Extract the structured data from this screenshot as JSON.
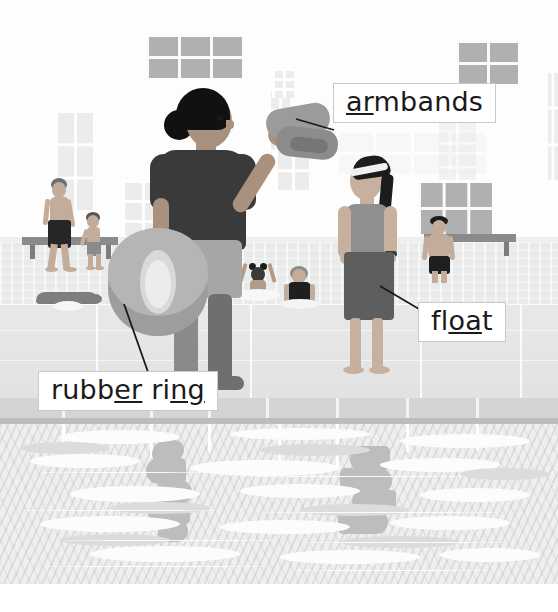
{
  "illustration": {
    "title": "Swimming pool vocabulary scene",
    "alt": "Cartoon swimming pool with a woman holding a rubber ring and armbands, a girl holding a float, and swimmers in the water",
    "width": 558,
    "height": 612
  },
  "labels": [
    {
      "id": "armbands",
      "name": "label-armbands",
      "text_before": "",
      "underlined": "ar",
      "text_after": "mbands",
      "full_text": "armbands",
      "x": 333,
      "y": 83,
      "leader": {
        "x1": 333,
        "y1": 131,
        "x2": 296,
        "y2": 121
      }
    },
    {
      "id": "float",
      "name": "label-float",
      "text_before": "fl",
      "underlined": "oa",
      "text_after": "t",
      "full_text": "float",
      "x": 418,
      "y": 302,
      "leader": {
        "x1": 418,
        "y1": 310,
        "x2": 381,
        "y2": 287
      }
    },
    {
      "id": "rubber-ring",
      "name": "label-rubber-ring",
      "text_before": "rubb",
      "underlined": "er",
      "text_mid": " ri",
      "underlined2": "ng",
      "text_after": "",
      "full_text": "rubber ring",
      "x": 38,
      "y": 371,
      "leader": {
        "x1": 147,
        "y1": 371,
        "x2": 123,
        "y2": 305
      }
    }
  ],
  "palette": {
    "paper": "#ffffff",
    "wall": "#fdfdfd",
    "window_dark": "#b0b0b0",
    "window_pale": "#ececec",
    "deck": "#e8e8e8",
    "coping": "#d4d4d4",
    "water": "#efefef",
    "water_dark": "#bcbcbc",
    "skin_mid": "#b9a08d",
    "skin_light": "#cdb7a4",
    "hair_dark": "#1c1c1c",
    "shirt_dark": "#3a3a3a",
    "swimsuit_grey": "#8f8f8f",
    "float_dark": "#5e5e5e",
    "ring_grey": "#a9a9a9",
    "ink": "#1a1a1a"
  },
  "figures": [
    {
      "name": "woman-with-ring",
      "description": "adult woman in dark t-shirt holding a rubber ring and armbands"
    },
    {
      "name": "girl-with-float",
      "description": "girl in swimsuit with goggles holding a float board"
    },
    {
      "name": "man-walking",
      "description": "man walking on the poolside holding a child's hand"
    },
    {
      "name": "child-walking",
      "description": "small child walking beside the man"
    },
    {
      "name": "child-in-water-arms-up",
      "description": "child in the pool with arms raised"
    },
    {
      "name": "woman-in-water",
      "description": "woman standing in the pool"
    },
    {
      "name": "boy-at-poolside",
      "description": "boy standing in shallow water at the far side"
    },
    {
      "name": "swimmer",
      "description": "person swimming in the far pool"
    }
  ]
}
